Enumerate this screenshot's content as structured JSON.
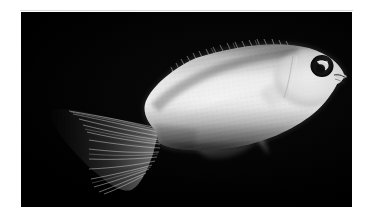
{
  "image": {
    "kind": "photograph",
    "subject": "fish",
    "common_description": "pale whitish fish in left-facing profile on black background",
    "orientation": "head to the right, tail to the left",
    "color_mode": "grayscale",
    "width_px": 372,
    "height_px": 220
  },
  "frame": {
    "mat_color": "#ffffff",
    "photo_background": "#000000",
    "top_rule_color": "#d9d9d9",
    "photo_left_px": 21,
    "photo_top_px": 12,
    "photo_width_px": 331,
    "photo_height_px": 195
  },
  "subject": {
    "body_color_light": "#e8e8e8",
    "body_color_mid": "#b8b8b8",
    "body_color_shadow": "#5a5a5a",
    "fin_color": "#8e8e8e",
    "fin_ray_color": "#cfcfcf",
    "eye_ring_color": "#0a0a0a",
    "eye_iris_color": "#2a2a2a",
    "eye_highlight_color": "#efefef",
    "parts": [
      {
        "name": "caudal-fin",
        "label": "Caudal fin (tail)"
      },
      {
        "name": "caudal-peduncle",
        "label": "Caudal peduncle"
      },
      {
        "name": "dorsal-fin",
        "label": "Dorsal fin"
      },
      {
        "name": "anal-fin",
        "label": "Anal fin"
      },
      {
        "name": "pelvic-fin",
        "label": "Pelvic fin"
      },
      {
        "name": "pectoral-fin",
        "label": "Pectoral fin"
      },
      {
        "name": "head",
        "label": "Head"
      },
      {
        "name": "eye",
        "label": "Eye"
      },
      {
        "name": "mouth",
        "label": "Mouth"
      },
      {
        "name": "opercle",
        "label": "Gill cover"
      }
    ]
  }
}
